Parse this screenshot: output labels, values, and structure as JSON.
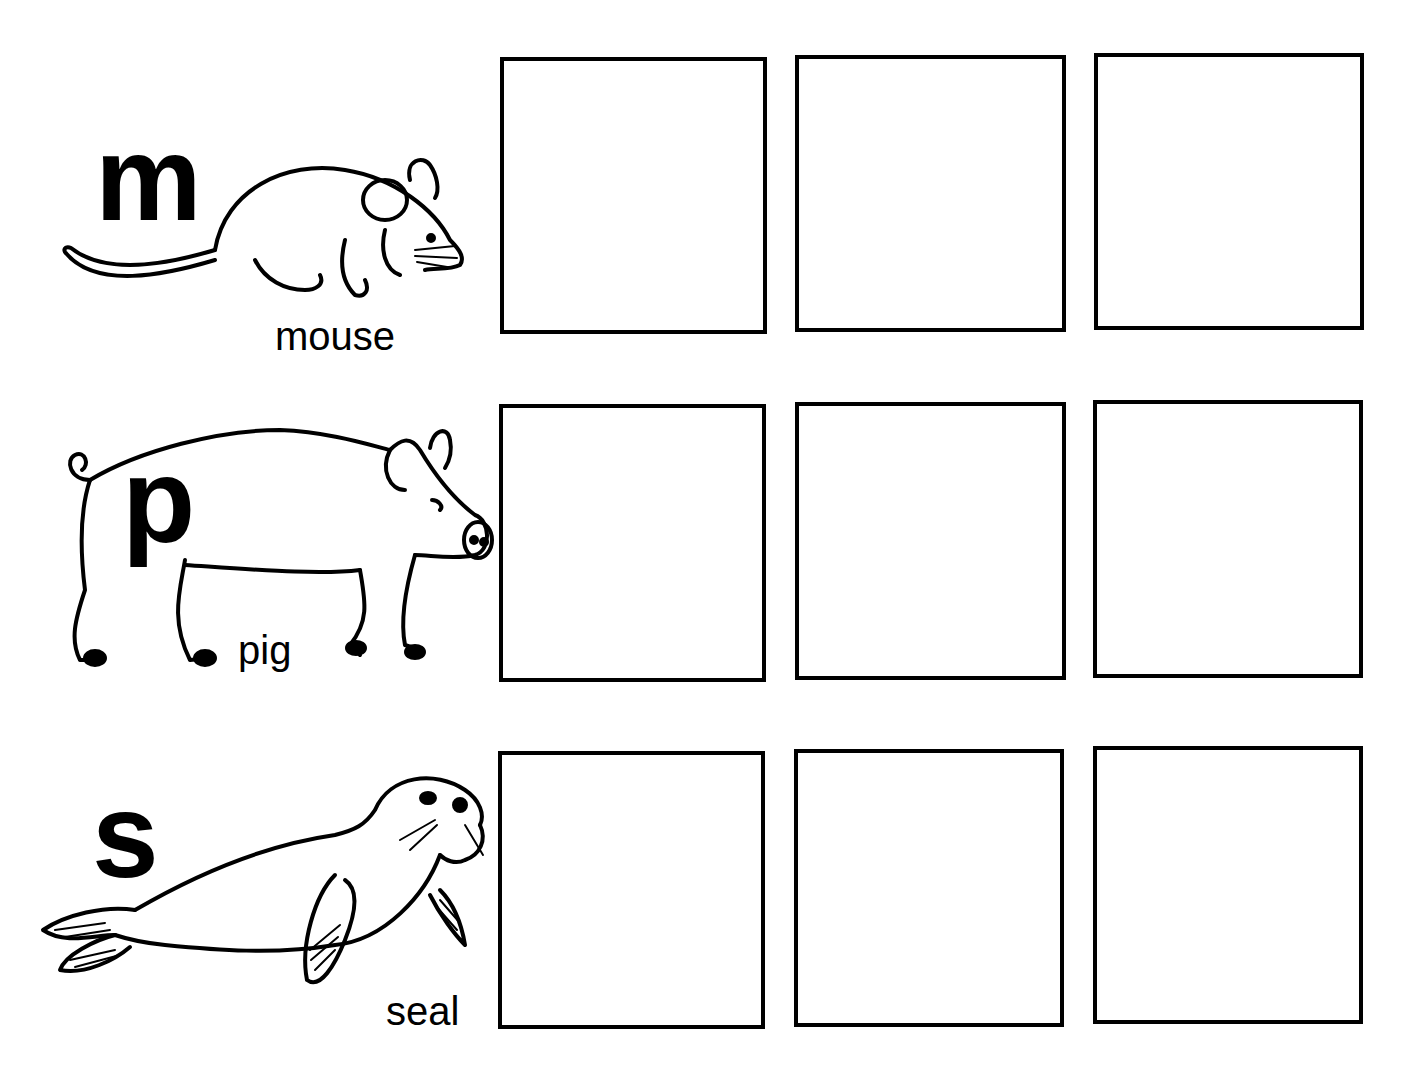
{
  "worksheet": {
    "rows": [
      {
        "letter": "m",
        "animal": "mouse",
        "boxes": 3
      },
      {
        "letter": "p",
        "animal": "pig",
        "boxes": 3
      },
      {
        "letter": "s",
        "animal": "seal",
        "boxes": 3
      }
    ]
  }
}
